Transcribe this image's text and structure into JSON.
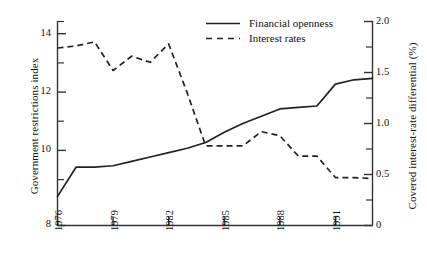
{
  "chart_data": {
    "type": "line",
    "title": "",
    "subtitle": "",
    "xlabel": "",
    "ylabel": "Government restrictions index",
    "ylabel_right": "Covered interest-rate differential (%)",
    "xlim": [
      1976,
      1993
    ],
    "ylim": [
      8,
      15
    ],
    "ylim_right": [
      0,
      2.0
    ],
    "grid": false,
    "legend_position": "top-center",
    "x_ticks": [
      "1976",
      "1979",
      "1982",
      "1985",
      "1988",
      "1991"
    ],
    "x_tick_values": [
      1976,
      1979,
      1982,
      1985,
      1988,
      1991
    ],
    "y_ticks_left": [
      "8",
      "10",
      "12",
      "14"
    ],
    "y_tick_values_left": [
      8,
      10,
      12,
      14
    ],
    "y_minor_values_left": [
      9,
      11,
      13,
      15
    ],
    "y_ticks_right": [
      "0",
      "0.5",
      "1.0",
      "1.5",
      "2.0"
    ],
    "y_tick_values_right": [
      0,
      0.5,
      1.0,
      1.5,
      2.0
    ],
    "y_minor_values_right": [
      0.25,
      0.75,
      1.25,
      1.75
    ],
    "series": [
      {
        "name": "Financial openness",
        "axis": "left",
        "style": "solid",
        "color": "#222222",
        "x": [
          1976,
          1977,
          1978,
          1979,
          1980,
          1981,
          1982,
          1983,
          1984,
          1985,
          1986,
          1987,
          1988,
          1989,
          1990,
          1991,
          1992,
          1993
        ],
        "values": [
          9.0,
          10.0,
          10.0,
          10.05,
          10.2,
          10.35,
          10.5,
          10.65,
          10.85,
          11.2,
          11.5,
          11.75,
          12.0,
          12.05,
          12.1,
          12.85,
          13.0,
          13.05
        ]
      },
      {
        "name": "Interest rates",
        "axis": "right",
        "style": "dashed",
        "color": "#222222",
        "x": [
          1976,
          1977,
          1978,
          1979,
          1980,
          1981,
          1982,
          1983,
          1984,
          1985,
          1986,
          1987,
          1988,
          1989,
          1990,
          1991,
          1992,
          1993
        ],
        "values": [
          1.74,
          1.76,
          1.8,
          1.52,
          1.66,
          1.6,
          1.78,
          1.3,
          0.78,
          0.78,
          0.78,
          0.92,
          0.88,
          0.68,
          0.68,
          0.47,
          0.47,
          0.46
        ]
      }
    ],
    "legend": [
      {
        "label": "Financial openness",
        "style": "solid"
      },
      {
        "label": "Interest rates",
        "style": "dashed"
      }
    ]
  },
  "axes": {
    "left_title": "Government restrictions index",
    "right_title": "Covered interest-rate differential (%)",
    "left_ticks": [
      {
        "label": "14"
      },
      {
        "label": "12"
      },
      {
        "label": "10"
      },
      {
        "label": "8"
      }
    ],
    "right_ticks": [
      {
        "label": "2.0"
      },
      {
        "label": "1.5"
      },
      {
        "label": "1.0"
      },
      {
        "label": "0.5"
      },
      {
        "label": "0"
      }
    ],
    "x_ticks": [
      {
        "label": "1976"
      },
      {
        "label": "1979"
      },
      {
        "label": "1982"
      },
      {
        "label": "1985"
      },
      {
        "label": "1988"
      },
      {
        "label": "1991"
      }
    ]
  },
  "legend": {
    "entry_financial_openness": "Financial openness",
    "entry_interest_rates": "Interest rates"
  },
  "colors": {
    "line": "#222222",
    "axis": "#333333",
    "background": "#ffffff"
  }
}
